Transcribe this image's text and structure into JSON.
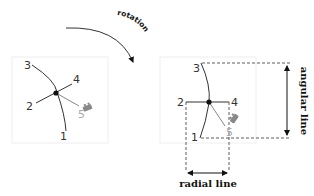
{
  "diagram": {
    "rotation_label": "rotation",
    "left_panel": {
      "labels": {
        "p1": "1",
        "p2": "2",
        "p3": "3",
        "p4": "4",
        "p5": "5"
      }
    },
    "right_panel": {
      "labels": {
        "p1": "1",
        "p2": "2",
        "p3": "3",
        "p4": "4",
        "p5": "5"
      },
      "angular_line_label": "angular line",
      "radial_line_label": "radial line"
    },
    "colors": {
      "line": "#333333",
      "faded": "#aaaaaa",
      "frame": "#eeeeee",
      "dashed": "#333333"
    }
  }
}
